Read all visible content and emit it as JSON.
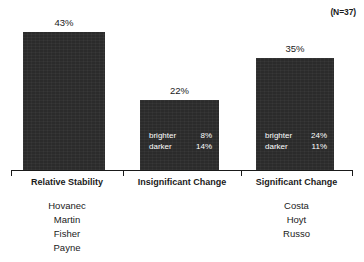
{
  "annotation": {
    "sample_size": "(N=37)"
  },
  "chart_data": {
    "type": "bar",
    "title": "",
    "subtitle": "",
    "xlabel": "",
    "ylabel": "",
    "ylim": [
      0,
      50
    ],
    "grid": false,
    "legend": "none",
    "annotations": [
      "(N=37)"
    ],
    "categories": [
      "Relative Stability",
      "Insignificant Change",
      "Significant Change"
    ],
    "values": [
      43,
      35,
      22
    ],
    "tick_labels": [
      "43%",
      "22%",
      "35%"
    ],
    "series": [
      {
        "name": "Percent of sample",
        "values": [
          43,
          22,
          35
        ]
      }
    ],
    "bars": [
      {
        "category": "Relative Stability",
        "value": 43,
        "value_label": "43%",
        "breakdown": [],
        "members": [
          "Hovanec",
          "Martin",
          "Fisher",
          "Payne"
        ]
      },
      {
        "category": "Insignificant Change",
        "value": 22,
        "value_label": "22%",
        "breakdown": [
          {
            "key": "brighter",
            "value": "8%"
          },
          {
            "key": "darker",
            "value": "14%"
          }
        ],
        "members": []
      },
      {
        "category": "Significant Change",
        "value": 35,
        "value_label": "35%",
        "breakdown": [
          {
            "key": "brighter",
            "value": "24%"
          },
          {
            "key": "darker",
            "value": "11%"
          }
        ],
        "members": [
          "Costa",
          "Hoyt",
          "Russo"
        ]
      }
    ],
    "colors": {
      "bar_fill": "#2b2b2b",
      "bar_text": "#ffffff",
      "axis": "#1a1a1a",
      "background": "#ffffff",
      "label_text": "#1a1a1a"
    }
  }
}
